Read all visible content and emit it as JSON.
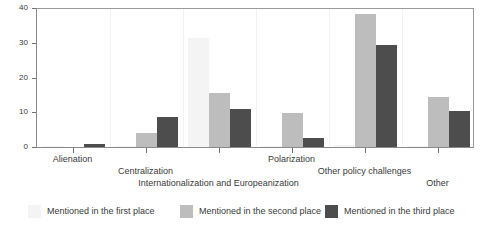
{
  "chart_data": {
    "type": "bar",
    "title": "",
    "xlabel": "",
    "ylabel": "",
    "ylim": [
      0,
      40
    ],
    "yticks": [
      0,
      10,
      20,
      30,
      40
    ],
    "grid": false,
    "legend_position": "bottom",
    "categories": [
      "Alienation",
      "Centralization",
      "Internationalization and Europeanization",
      "Polarization",
      "Other policy challenges",
      "Other"
    ],
    "series": [
      {
        "name": "Mentioned in the first place",
        "color": "#f4f4f4",
        "values": [
          0.3,
          0.2,
          31.5,
          0.2,
          0.6,
          0.2
        ]
      },
      {
        "name": "Mentioned in the second place",
        "color": "#bdbdbd",
        "values": [
          0,
          3.9,
          15.5,
          9.7,
          38.3,
          14.5
        ]
      },
      {
        "name": "Mentioned in the third place",
        "color": "#4d4d4d",
        "values": [
          1.0,
          8.7,
          11.0,
          2.7,
          29.3,
          10.5
        ]
      }
    ]
  },
  "axis": {
    "y_tick_labels": [
      "0",
      "10",
      "20",
      "30",
      "40"
    ]
  },
  "legend": {
    "items": [
      {
        "label": "Mentioned in the first place",
        "color": "#f4f4f4"
      },
      {
        "label": "Mentioned in the second place",
        "color": "#bdbdbd"
      },
      {
        "label": "Mentioned in the third place",
        "color": "#4d4d4d"
      }
    ]
  }
}
